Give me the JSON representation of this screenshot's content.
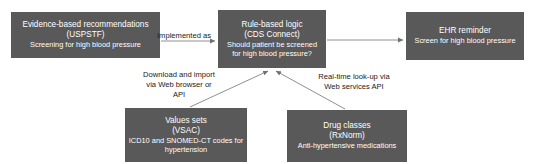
{
  "diagram": {
    "box_fill_color": "#595959",
    "box_text_color": "#ffffff",
    "connector_color": "#808080",
    "background_color": "#ffffff",
    "nodes": [
      {
        "id": "uspstf",
        "line1": "Evidence-based recommendations",
        "line2": "(USPSTF)",
        "line3": "Screening for high blood pressure"
      },
      {
        "id": "cds",
        "line1": "Rule-based logic",
        "line2": "(CDS Connect)",
        "line3": "Should patient be screened",
        "line4": "for high blood pressure?"
      },
      {
        "id": "ehr",
        "line1": "EHR reminder",
        "line2": "Screen for high blood pressure"
      },
      {
        "id": "vsac",
        "line1": "Values sets",
        "line2": "(VSAC)",
        "line3": "ICD10 and SNOMED-CT codes for",
        "line4": "hypertension"
      },
      {
        "id": "rxnorm",
        "line1": "Drug classes",
        "line2": "(RxNorm)",
        "line3": "Anti-hypertensive medications"
      }
    ],
    "connectors": [
      {
        "id": "implemented-as",
        "label": "Implemented as",
        "from": "uspstf",
        "to": "cds"
      },
      {
        "id": "cds-to-ehr",
        "label": "",
        "from": "cds",
        "to": "ehr"
      },
      {
        "id": "download-import",
        "line1": "Download and import",
        "line2": "via Web browser or",
        "line3": "API",
        "from": "vsac",
        "to": "cds"
      },
      {
        "id": "real-time-lookup",
        "line1": "Real-time look-up via",
        "line2": "Web services API",
        "from": "rxnorm",
        "to": "cds"
      }
    ]
  }
}
